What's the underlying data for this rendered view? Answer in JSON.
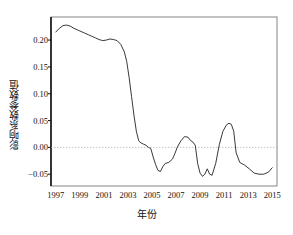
{
  "chart_data": {
    "type": "line",
    "title": "",
    "subtitle": "",
    "xlabel": "年份",
    "ylabel": "影响系数参数值",
    "xlim": [
      1996.6,
      2015.4
    ],
    "ylim": [
      -0.072,
      0.243
    ],
    "grid": false,
    "legend": null,
    "zero_line": {
      "value": 0.0,
      "style": "dotted",
      "color": "#aaaaaa"
    },
    "series": [
      {
        "name": "影响系数参数值",
        "color": "#222222",
        "x": [
          1997.0,
          1997.3,
          1997.6,
          1997.9,
          1998.2,
          1998.5,
          1998.8,
          1999.1,
          1999.4,
          1999.7,
          2000.0,
          2000.3,
          2000.6,
          2000.9,
          2001.2,
          2001.5,
          2001.8,
          2002.1,
          2002.4,
          2002.7,
          2002.9,
          2003.1,
          2003.3,
          2003.5,
          2003.7,
          2003.9,
          2004.1,
          2004.3,
          2004.5,
          2004.7,
          2004.9,
          2005.1,
          2005.3,
          2005.5,
          2005.7,
          2005.9,
          2006.1,
          2006.4,
          2006.7,
          2006.9,
          2007.1,
          2007.4,
          2007.7,
          2008.0,
          2008.2,
          2008.4,
          2008.6,
          2008.8,
          2009.0,
          2009.2,
          2009.4,
          2009.6,
          2009.8,
          2010.0,
          2010.3,
          2010.6,
          2010.9,
          2011.2,
          2011.4,
          2011.6,
          2011.8,
          2012.0,
          2012.3,
          2012.7,
          2013.1,
          2013.5,
          2013.9,
          2014.3,
          2014.7,
          2015.0
        ],
        "y": [
          0.215,
          0.222,
          0.227,
          0.228,
          0.226,
          0.222,
          0.219,
          0.216,
          0.213,
          0.21,
          0.207,
          0.204,
          0.201,
          0.199,
          0.2,
          0.202,
          0.201,
          0.199,
          0.192,
          0.178,
          0.16,
          0.13,
          0.095,
          0.06,
          0.03,
          0.012,
          0.008,
          0.006,
          0.004,
          0.0,
          -0.002,
          -0.018,
          -0.032,
          -0.043,
          -0.045,
          -0.036,
          -0.03,
          -0.028,
          -0.022,
          -0.012,
          0.0,
          0.012,
          0.02,
          0.019,
          0.013,
          0.01,
          0.004,
          -0.03,
          -0.048,
          -0.054,
          -0.05,
          -0.04,
          -0.05,
          -0.052,
          -0.03,
          0.005,
          0.03,
          0.042,
          0.045,
          0.043,
          0.03,
          -0.01,
          -0.028,
          -0.033,
          -0.04,
          -0.048,
          -0.05,
          -0.05,
          -0.046,
          -0.038
        ]
      }
    ],
    "yticks": [
      {
        "value": 0.2,
        "label": "0.20"
      },
      {
        "value": 0.15,
        "label": "0.15"
      },
      {
        "value": 0.1,
        "label": "0.10"
      },
      {
        "value": 0.05,
        "label": "0.05"
      },
      {
        "value": 0.0,
        "label": "0.00"
      },
      {
        "value": -0.05,
        "label": "-0.05"
      }
    ],
    "xticks": [
      {
        "value": 1997,
        "label": "1997"
      },
      {
        "value": 1999,
        "label": "1999"
      },
      {
        "value": 2001,
        "label": "2001"
      },
      {
        "value": 2003,
        "label": "2003"
      },
      {
        "value": 2005,
        "label": "2005"
      },
      {
        "value": 2007,
        "label": "2007"
      },
      {
        "value": 2009,
        "label": "2009"
      },
      {
        "value": 2011,
        "label": "2011"
      },
      {
        "value": 2013,
        "label": "2013"
      },
      {
        "value": 2015,
        "label": "2015"
      }
    ]
  },
  "plot": {
    "frame_color": "#555555",
    "axis_color": "#111111",
    "background": "#ffffff"
  }
}
